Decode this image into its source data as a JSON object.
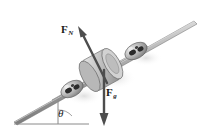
{
  "figure": {
    "background_color": "#ffffff",
    "width": 206,
    "height": 133
  },
  "labels": {
    "normal_force": {
      "symbol": "F",
      "subscript": "N",
      "full": "F_N",
      "meaning": "normal-force",
      "x": 61,
      "y": 24,
      "color": "#1a1a1a"
    },
    "gravity_force": {
      "symbol": "F",
      "subscript": "g",
      "full": "F_g",
      "meaning": "gravitational-force",
      "x": 106,
      "y": 87,
      "color": "#1a1a1a"
    },
    "incline_angle": {
      "symbol": "θ",
      "meaning": "incline-angle",
      "x": 58,
      "y": 108,
      "color": "#1a1a1a"
    }
  },
  "vectors": [
    {
      "name": "normal-force-vector",
      "label": "F_N",
      "direction": "up-left, perpendicular to incline surface",
      "tail": [
        106,
        82
      ],
      "head": [
        79,
        30
      ],
      "color": "#4d4d4d"
    },
    {
      "name": "gravity-force-vector",
      "label": "F_g",
      "direction": "straight down, vertical",
      "tail": [
        104,
        72
      ],
      "head": [
        104,
        124
      ],
      "color": "#4d4d4d"
    }
  ],
  "geometry": {
    "rails": {
      "name": "inclined-rails",
      "count": 2,
      "color": "#9a9a9a",
      "edge_color": "#6b6b6b",
      "near_rail": {
        "start": [
          14,
          122
        ],
        "end": [
          196,
          22
        ]
      },
      "far_rail": {
        "start": [
          58,
          95
        ],
        "end": [
          150,
          44
        ]
      }
    },
    "ground_line": {
      "name": "horizontal-ground-line",
      "start": [
        14,
        122
      ],
      "end": [
        88,
        122
      ],
      "color": "#8a8a8a"
    },
    "vertical_reference": {
      "name": "vertical-reference-line",
      "start": [
        58,
        99
      ],
      "end": [
        58,
        122
      ],
      "color": "#8a8a8a"
    },
    "cylinder": {
      "name": "central-cylinder",
      "center": [
        101,
        70
      ],
      "radius_x": 15,
      "radius_y": 17,
      "fill": "#c9c9c9",
      "stroke": "#6e6e6e"
    },
    "rollers": [
      {
        "name": "lower-left-roller",
        "center": [
          72,
          89
        ],
        "rx": 11,
        "ry": 7,
        "fill": "#b5b5b5"
      },
      {
        "name": "upper-right-roller",
        "center": [
          135,
          51
        ],
        "rx": 11,
        "ry": 7,
        "fill": "#b5b5b5"
      }
    ]
  },
  "colors": {
    "ink": "#1a1a1a",
    "rail_fill": "#a6a6a6",
    "rail_stroke": "#666666",
    "arrow": "#4d4d4d",
    "shadow": "#e2e2e2",
    "cylinder_fill": "#c6c6c6",
    "cylinder_stroke": "#6e6e6e",
    "roller_dark": "#2b2b2b"
  }
}
